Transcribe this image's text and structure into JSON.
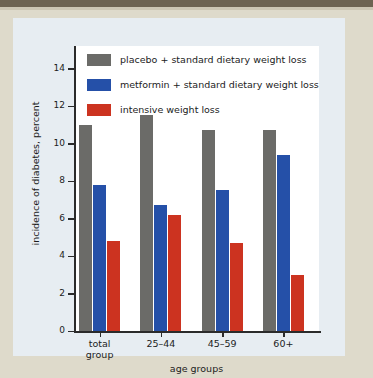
{
  "chart_data": {
    "type": "bar",
    "title": "",
    "xlabel": "age groups",
    "ylabel": "incidence of diabetes, percent",
    "categories": [
      "total\ngroup",
      "25–44",
      "45–59",
      "60+"
    ],
    "series": [
      {
        "name": "placebo + standard dietary weight loss",
        "color": "#6b6b68",
        "values": [
          11.0,
          11.5,
          10.7,
          10.7
        ]
      },
      {
        "name": "metformin + standard dietary weight loss",
        "color": "#2550a8",
        "values": [
          7.8,
          6.7,
          7.5,
          9.4
        ]
      },
      {
        "name": "intensive weight loss",
        "color": "#cc3320",
        "values": [
          4.8,
          6.2,
          4.7,
          3.0
        ]
      }
    ],
    "ylim": [
      0,
      15.2
    ],
    "yticks": [
      0,
      2,
      4,
      6,
      8,
      10,
      12,
      14
    ],
    "ytick_labels": [
      "0",
      "2",
      "4",
      "6",
      "8",
      "10",
      "12",
      "14"
    ],
    "grid": false,
    "legend_position": "top-left"
  },
  "legend": {
    "items": [
      {
        "label": "placebo + standard dietary weight loss",
        "swatch": "placebo"
      },
      {
        "label": "metformin + standard dietary weight loss",
        "swatch": "metformin"
      },
      {
        "label": "intensive weight loss",
        "swatch": "intensive"
      }
    ]
  },
  "colors": {
    "placebo": "#6b6b68",
    "metformin": "#2550a8",
    "intensive": "#cc3320",
    "panel": "#e7edf2",
    "page": "#dedacb",
    "plot": "#ffffff",
    "axis": "#2b2b2b"
  }
}
